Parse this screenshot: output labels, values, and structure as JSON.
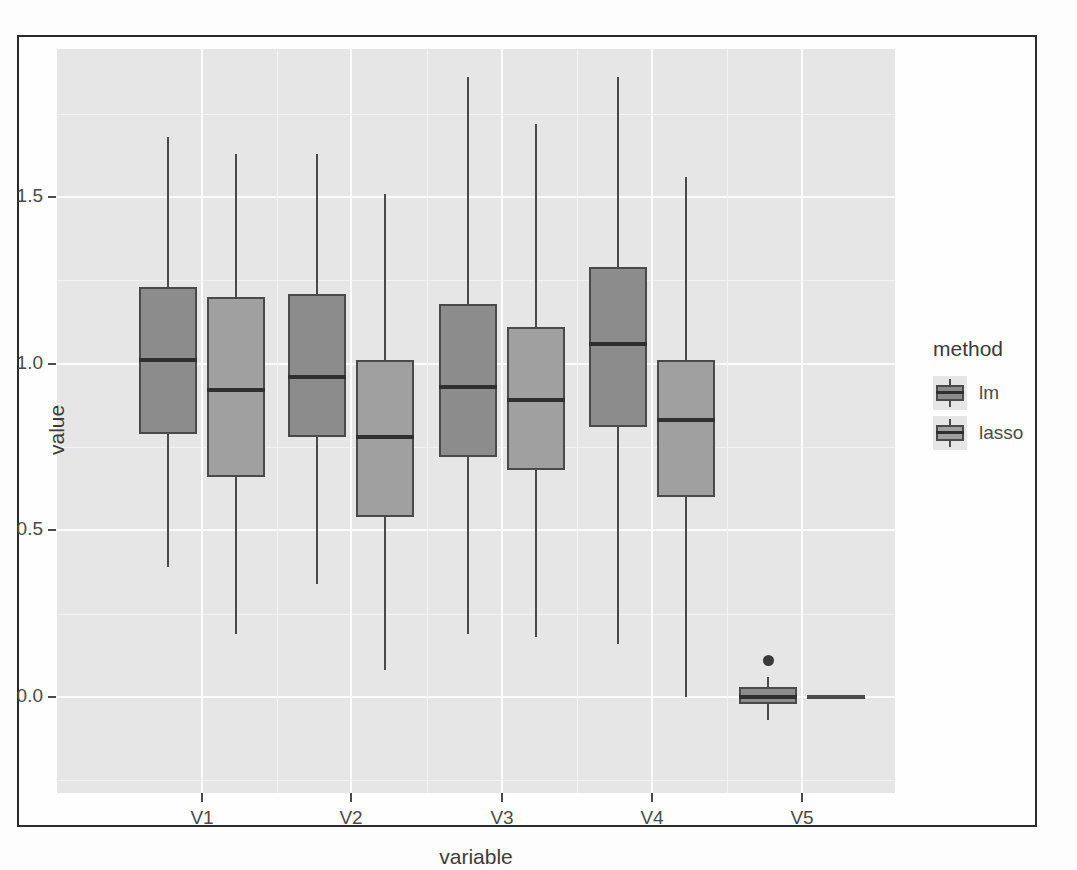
{
  "chart_data": {
    "type": "box",
    "title": "",
    "xlabel": "variable",
    "ylabel": "value",
    "categories": [
      "V1",
      "V2",
      "V3",
      "V4",
      "V5"
    ],
    "ytick_labels": [
      "0.0",
      "0.5",
      "1.0",
      "1.5"
    ],
    "ytick_values": [
      0.0,
      0.5,
      1.0,
      1.5
    ],
    "ylim": [
      -0.13,
      1.97
    ],
    "grid": true,
    "legend_position": "right",
    "legend_title": "method",
    "series": [
      {
        "name": "lm",
        "color": "#8c8c8c",
        "boxes": [
          {
            "category": "V1",
            "lower_whisker": 0.39,
            "q1": 0.79,
            "median": 1.01,
            "q3": 1.23,
            "upper_whisker": 1.68,
            "outliers": []
          },
          {
            "category": "V2",
            "lower_whisker": 0.34,
            "q1": 0.78,
            "median": 0.96,
            "q3": 1.21,
            "upper_whisker": 1.63,
            "outliers": []
          },
          {
            "category": "V3",
            "lower_whisker": 0.19,
            "q1": 0.72,
            "median": 0.93,
            "q3": 1.18,
            "upper_whisker": 1.86,
            "outliers": []
          },
          {
            "category": "V4",
            "lower_whisker": 0.16,
            "q1": 0.81,
            "median": 1.06,
            "q3": 1.29,
            "upper_whisker": 1.86,
            "outliers": []
          },
          {
            "category": "V5",
            "lower_whisker": -0.07,
            "q1": -0.02,
            "median": 0.0,
            "q3": 0.03,
            "upper_whisker": 0.06,
            "outliers": [
              0.11
            ]
          }
        ]
      },
      {
        "name": "lasso",
        "color": "#a0a0a0",
        "boxes": [
          {
            "category": "V1",
            "lower_whisker": 0.19,
            "q1": 0.66,
            "median": 0.92,
            "q3": 1.2,
            "upper_whisker": 1.63,
            "outliers": []
          },
          {
            "category": "V2",
            "lower_whisker": 0.08,
            "q1": 0.54,
            "median": 0.78,
            "q3": 1.01,
            "upper_whisker": 1.51,
            "outliers": []
          },
          {
            "category": "V3",
            "lower_whisker": 0.18,
            "q1": 0.68,
            "median": 0.89,
            "q3": 1.11,
            "upper_whisker": 1.72,
            "outliers": []
          },
          {
            "category": "V4",
            "lower_whisker": 0.0,
            "q1": 0.6,
            "median": 0.83,
            "q3": 1.01,
            "upper_whisker": 1.56,
            "outliers": []
          },
          {
            "category": "V5",
            "lower_whisker": 0.0,
            "q1": 0.0,
            "median": 0.0,
            "q3": 0.0,
            "upper_whisker": 0.0,
            "outliers": []
          }
        ]
      }
    ]
  },
  "legend": {
    "title": "method",
    "items": [
      {
        "label": "lm"
      },
      {
        "label": "lasso"
      }
    ]
  },
  "axes": {
    "x_title": "variable",
    "y_title": "value"
  },
  "colors": {
    "panel_background": "#e6e6e6",
    "major_gridline": "#fbfbfb",
    "minor_gridline": "#f2f2f2",
    "box_outline": "#4a4a4a",
    "median": "#2f2f2f",
    "frame": "#2b2b2b",
    "lm_fill": "#8c8c8c",
    "lasso_fill": "#a0a0a0"
  }
}
